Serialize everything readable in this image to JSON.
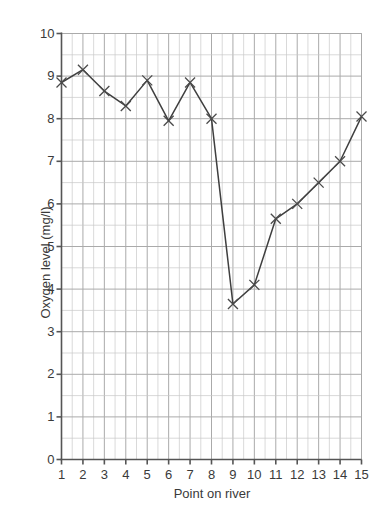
{
  "chart_data": {
    "type": "line",
    "title": "",
    "xlabel": "Point on river",
    "ylabel": "Oxygen level (mg/l)",
    "x": [
      1,
      2,
      3,
      4,
      5,
      6,
      7,
      8,
      9,
      10,
      11,
      12,
      13,
      14,
      15
    ],
    "values": [
      8.85,
      9.15,
      8.65,
      8.3,
      8.9,
      7.95,
      8.85,
      8.0,
      3.65,
      4.1,
      5.65,
      6.0,
      6.5,
      7.0,
      8.05
    ],
    "series": [
      {
        "name": "Oxygen level",
        "values": [
          8.85,
          9.15,
          8.65,
          8.3,
          8.9,
          7.95,
          8.85,
          8.0,
          3.65,
          4.1,
          5.65,
          6.0,
          6.5,
          7.0,
          8.05
        ]
      }
    ],
    "xlim": [
      1,
      15
    ],
    "ylim": [
      0,
      10
    ],
    "x_tick_labels": [
      "1",
      "2",
      "3",
      "4",
      "5",
      "6",
      "7",
      "8",
      "9",
      "10",
      "11",
      "12",
      "13",
      "14",
      "15"
    ],
    "y_tick_labels": [
      "0",
      "1",
      "2",
      "3",
      "4",
      "5",
      "6",
      "7",
      "8",
      "9",
      "10"
    ],
    "y_ticks": [
      0,
      1,
      2,
      3,
      4,
      5,
      6,
      7,
      8,
      9,
      10
    ],
    "y_minor_step": 0.5,
    "grid": true,
    "legend": "none",
    "marker": "x-cross",
    "line_color": "#3f3f3f",
    "grid_color": "#aaaaaa",
    "axis_color": "#555555",
    "background": "#ffffff"
  }
}
